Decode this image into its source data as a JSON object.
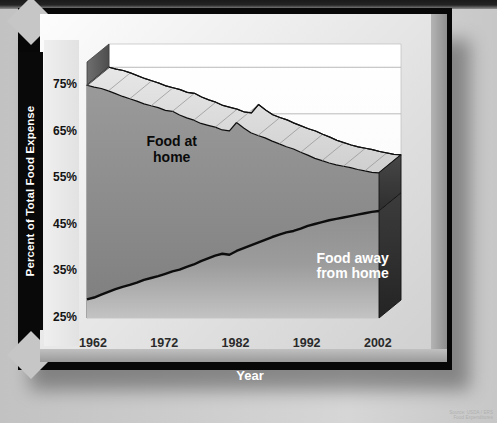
{
  "chart_data": {
    "type": "area",
    "title": "",
    "subtitle": "",
    "xlabel": "Year",
    "ylabel": "Percent of Total Food Expense",
    "xlim": [
      1962,
      2003
    ],
    "ylim": [
      25,
      80
    ],
    "yticks": [
      "75%",
      "65%",
      "55%",
      "45%",
      "35%",
      "25%"
    ],
    "ytick_values": [
      75,
      65,
      55,
      45,
      35,
      25
    ],
    "xticks": [
      "1962",
      "1972",
      "1982",
      "1992",
      "2002"
    ],
    "xtick_values": [
      1962,
      1972,
      1982,
      1992,
      2002
    ],
    "grid": true,
    "grid_axis": "y",
    "legend_position": "in-plot-annotations",
    "x": [
      1962,
      1963,
      1964,
      1965,
      1966,
      1967,
      1968,
      1969,
      1970,
      1971,
      1972,
      1973,
      1974,
      1975,
      1976,
      1977,
      1978,
      1979,
      1980,
      1981,
      1982,
      1983,
      1984,
      1985,
      1986,
      1987,
      1988,
      1989,
      1990,
      1991,
      1992,
      1993,
      1994,
      1995,
      1996,
      1997,
      1998,
      1999,
      2000,
      2001,
      2002,
      2003
    ],
    "series": [
      {
        "name": "Food at home",
        "color": "#8d8d8d",
        "label_color": "#0a0a0a",
        "values": [
          75.0,
          74.6,
          74.3,
          73.8,
          73.2,
          72.6,
          72.1,
          71.6,
          71.0,
          70.6,
          70.2,
          69.6,
          69.4,
          68.6,
          68.0,
          67.5,
          66.8,
          66.4,
          66.0,
          65.4,
          65.2,
          67.0,
          65.8,
          64.8,
          64.2,
          63.7,
          63.0,
          62.4,
          61.8,
          61.3,
          60.6,
          60.0,
          59.3,
          58.8,
          58.3,
          57.9,
          57.6,
          57.3,
          56.9,
          56.6,
          56.3,
          56.2
        ]
      },
      {
        "name": "Food away from home",
        "color": "#9b9b9b",
        "label_color": "#ffffff",
        "values": [
          29.0,
          29.4,
          30.0,
          30.6,
          31.2,
          31.7,
          32.1,
          32.6,
          33.2,
          33.6,
          34.0,
          34.5,
          35.0,
          35.4,
          36.0,
          36.5,
          37.2,
          37.8,
          38.4,
          38.8,
          38.6,
          39.4,
          40.0,
          40.6,
          41.2,
          41.8,
          42.4,
          42.9,
          43.4,
          43.7,
          44.2,
          44.8,
          45.2,
          45.6,
          46.0,
          46.3,
          46.6,
          46.9,
          47.2,
          47.5,
          47.8,
          48.0
        ]
      }
    ],
    "annotations": [
      {
        "text": "Food at\nhome",
        "series": "Food at home",
        "color": "#0a0a0a"
      },
      {
        "text": "Food away\nfrom home",
        "series": "Food away from home",
        "color": "#ffffff"
      }
    ]
  },
  "axes": {
    "y_title": "Percent of Total Food Expense",
    "x_title": "Year",
    "y_labels": [
      "75%",
      "65%",
      "55%",
      "45%",
      "35%",
      "25%"
    ],
    "x_labels": [
      "1962",
      "1972",
      "1982",
      "1992",
      "2002"
    ]
  },
  "labels": {
    "food_at_home": "Food at\nhome",
    "food_away_from_home": "Food away\nfrom home"
  },
  "colors": {
    "band_top": "#d9d9d9",
    "area_upper": "#8d8d8d",
    "area_lower": "#9b9b9b",
    "extrude_dark": "#3a3a3a",
    "frame_black": "#070707",
    "plot_background": "#fbfbfb",
    "page_background": "#c9c9c9"
  },
  "credit": {
    "line1": "Source: USDA / ERS",
    "line2": "Food Expenditures"
  }
}
